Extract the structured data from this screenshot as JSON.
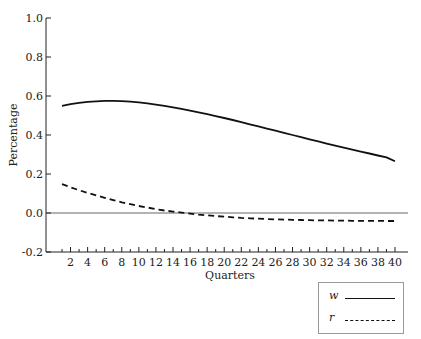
{
  "chart_data": {
    "type": "line",
    "title": "",
    "xlabel": "Quarters",
    "ylabel": "Percentage",
    "xlim": [
      1,
      40
    ],
    "ylim": [
      -0.2,
      1.0
    ],
    "yticks": [
      "-0.2",
      "0.0",
      "0.2",
      "0.4",
      "0.6",
      "0.8",
      "1.0"
    ],
    "xticks": [
      "2",
      "4",
      "6",
      "8",
      "10",
      "12",
      "14",
      "16",
      "18",
      "20",
      "22",
      "24",
      "26",
      "28",
      "30",
      "32",
      "34",
      "36",
      "38",
      "40"
    ],
    "grid": false,
    "zero_line": true,
    "legend_position": "bottom-right outside",
    "x": [
      1,
      2,
      3,
      4,
      5,
      6,
      7,
      8,
      9,
      10,
      11,
      12,
      13,
      14,
      15,
      16,
      17,
      18,
      19,
      20,
      21,
      22,
      23,
      24,
      25,
      26,
      27,
      28,
      29,
      30,
      31,
      32,
      33,
      34,
      35,
      36,
      37,
      38,
      39,
      40
    ],
    "series": [
      {
        "name": "w",
        "style": "solid",
        "values": [
          0.55,
          0.558,
          0.565,
          0.57,
          0.573,
          0.575,
          0.575,
          0.574,
          0.571,
          0.567,
          0.562,
          0.556,
          0.549,
          0.542,
          0.534,
          0.525,
          0.516,
          0.507,
          0.497,
          0.487,
          0.477,
          0.466,
          0.455,
          0.444,
          0.433,
          0.422,
          0.411,
          0.4,
          0.389,
          0.378,
          0.367,
          0.356,
          0.345,
          0.335,
          0.325,
          0.315,
          0.305,
          0.295,
          0.285,
          0.265
        ]
      },
      {
        "name": "r",
        "style": "dashed",
        "values": [
          0.148,
          0.132,
          0.117,
          0.103,
          0.09,
          0.078,
          0.066,
          0.055,
          0.045,
          0.036,
          0.028,
          0.02,
          0.013,
          0.007,
          0.002,
          -0.003,
          -0.008,
          -0.012,
          -0.016,
          -0.019,
          -0.022,
          -0.025,
          -0.027,
          -0.029,
          -0.031,
          -0.033,
          -0.034,
          -0.035,
          -0.036,
          -0.037,
          -0.038,
          -0.038,
          -0.039,
          -0.039,
          -0.04,
          -0.04,
          -0.04,
          -0.04,
          -0.041,
          -0.041
        ]
      }
    ]
  },
  "legend": {
    "items": [
      {
        "label": "w",
        "style": "solid"
      },
      {
        "label": "r",
        "style": "dashed"
      }
    ]
  }
}
